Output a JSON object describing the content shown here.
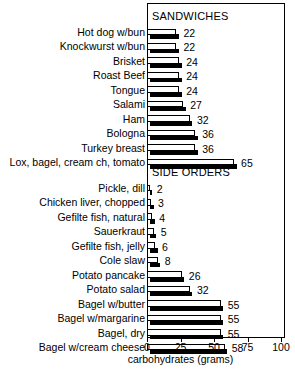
{
  "chart_data": {
    "type": "bar",
    "orientation": "horizontal",
    "title": "",
    "xlabel": "carbohydrates (grams)",
    "ylabel": "",
    "xlim": [
      0,
      100
    ],
    "xticks": [
      0,
      25,
      50,
      75,
      100
    ],
    "grid": false,
    "legend": null,
    "sections": [
      {
        "name": "SANDWICHES",
        "categories": [
          "Hot dog w/bun",
          "Knockwurst w/bun",
          "Brisket",
          "Roast Beef",
          "Tongue",
          "Salami",
          "Ham",
          "Bologna",
          "Turkey breast",
          "Lox, bagel, cream ch, tomato"
        ],
        "values": [
          22,
          22,
          24,
          24,
          24,
          27,
          32,
          36,
          36,
          65
        ]
      },
      {
        "name": "SIDE ORDERS",
        "categories": [
          "Pickle, dill",
          "Chicken liver, chopped",
          "Gefilte fish, natural",
          "Sauerkraut",
          "Gefilte fish, jelly",
          "Cole slaw",
          "Potato pancake",
          "Potato salad",
          "Bagel w/butter",
          "Bagel w/margarine",
          "Bagel, dry",
          "Bagel w/cream cheese"
        ],
        "values": [
          2,
          3,
          4,
          5,
          6,
          8,
          26,
          32,
          55,
          55,
          55,
          58
        ]
      }
    ],
    "categories": [
      "Hot dog w/bun",
      "Knockwurst w/bun",
      "Brisket",
      "Roast Beef",
      "Tongue",
      "Salami",
      "Ham",
      "Bologna",
      "Turkey breast",
      "Lox, bagel, cream ch, tomato",
      "Pickle, dill",
      "Chicken liver, chopped",
      "Gefilte fish, natural",
      "Sauerkraut",
      "Gefilte fish, jelly",
      "Cole slaw",
      "Potato pancake",
      "Potato salad",
      "Bagel w/butter",
      "Bagel w/margarine",
      "Bagel, dry",
      "Bagel w/cream cheese"
    ],
    "values": [
      22,
      22,
      24,
      24,
      24,
      27,
      32,
      36,
      36,
      65,
      2,
      3,
      4,
      5,
      6,
      8,
      26,
      32,
      55,
      55,
      55,
      58
    ],
    "colors": {
      "bar_face": "#ffffff",
      "bar_outline": "#000000",
      "bar_shadow": "#000000",
      "frame": "#000000",
      "text": "#000000",
      "background": "#ffffff"
    }
  }
}
